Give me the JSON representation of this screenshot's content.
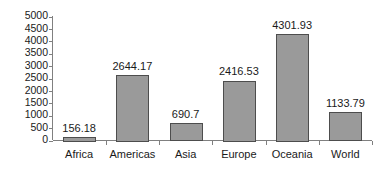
{
  "chart_data": {
    "type": "bar",
    "title": "",
    "subtitle": "",
    "xlabel": "",
    "ylabel": "",
    "categories": [
      "Africa",
      "Americas",
      "Asia",
      "Europe",
      "Oceania",
      "World"
    ],
    "values": [
      156.18,
      2644.17,
      690.7,
      2416.53,
      4301.93,
      1133.79
    ],
    "value_labels": [
      "156.18",
      "2644.17",
      "690.7",
      "2416.53",
      "4301.93",
      "1133.79"
    ],
    "ylim": [
      0,
      5000
    ],
    "ytick_labels": [
      "0",
      "500",
      "1000",
      "1500",
      "2000",
      "2500",
      "3000",
      "3500",
      "4000",
      "4500",
      "5000"
    ],
    "ytick_values": [
      0,
      500,
      1000,
      1500,
      2000,
      2500,
      3000,
      3500,
      4000,
      4500,
      5000
    ],
    "grid": false,
    "legend": false,
    "legend_position": "none",
    "series_name": "",
    "colors": {
      "bar_fill": "#9a9a9a",
      "bar_edge": "#4d4d4d",
      "axis": "#808080",
      "text": "#1a1a1a",
      "background": "#ffffff"
    }
  }
}
